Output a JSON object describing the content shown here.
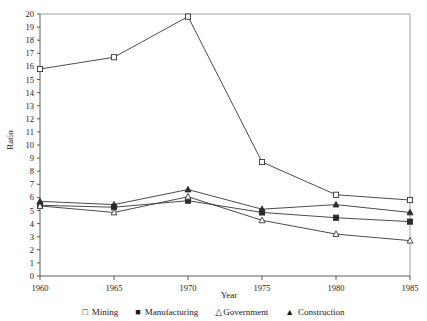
{
  "chart_data": {
    "type": "line",
    "title": "",
    "xlabel": "Year",
    "ylabel": "Ratio",
    "x": [
      1960,
      1965,
      1970,
      1975,
      1980,
      1985
    ],
    "xticklabels": [
      "1960",
      "1965",
      "1970",
      "1975",
      "1980",
      "1985"
    ],
    "xlim": [
      1960,
      1985
    ],
    "ylim": [
      0,
      20
    ],
    "yticks": [
      0,
      1,
      2,
      3,
      4,
      5,
      6,
      7,
      8,
      9,
      10,
      11,
      12,
      13,
      14,
      15,
      16,
      17,
      18,
      19,
      20
    ],
    "yticklabels": [
      "0",
      "1",
      "2",
      "3",
      "4",
      "5",
      "6",
      "7",
      "8",
      "9",
      "10",
      "11",
      "12",
      "13",
      "14",
      "15",
      "16",
      "17",
      "18",
      "19",
      "20"
    ],
    "grid": false,
    "legend_position": "below",
    "series": [
      {
        "name": "Mining",
        "marker": "open-square",
        "values": [
          15.8,
          16.7,
          19.8,
          8.7,
          6.2,
          5.8
        ]
      },
      {
        "name": "Manufacturing",
        "marker": "filled-square",
        "values": [
          5.4,
          5.25,
          5.75,
          4.85,
          4.45,
          4.15
        ]
      },
      {
        "name": "Government",
        "marker": "open-triangle",
        "values": [
          5.35,
          4.85,
          6.05,
          4.25,
          3.2,
          2.7
        ]
      },
      {
        "name": "Construction",
        "marker": "filled-triangle",
        "values": [
          5.7,
          5.45,
          6.6,
          5.1,
          5.45,
          4.85
        ]
      }
    ]
  },
  "legend": {
    "items": [
      {
        "label": "Mining",
        "glyph": "□"
      },
      {
        "label": "Manufacturing",
        "glyph": "■"
      },
      {
        "label": "Government",
        "glyph": "△"
      },
      {
        "label": "Construction",
        "glyph": "▲"
      }
    ]
  },
  "axes": {
    "x_title": "Year",
    "y_title": "Ratio"
  }
}
